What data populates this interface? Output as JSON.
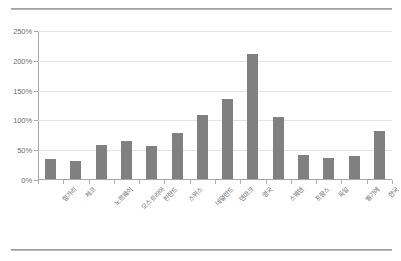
{
  "chart_data": {
    "type": "bar",
    "title": "",
    "xlabel": "",
    "ylabel": "",
    "ylim": [
      0,
      250
    ],
    "ytick_labels": [
      "0%",
      "50%",
      "100%",
      "150%",
      "200%",
      "250%"
    ],
    "ytick_values": [
      0,
      50,
      100,
      150,
      200,
      250
    ],
    "grid": true,
    "legend": false,
    "bar_color": "#808080",
    "gridline_color": "#e3e3e3",
    "axis_color": "#a6a6a6",
    "label_color": "#6b6b6b",
    "categories": [
      "헝가리",
      "체코",
      "노르웨이",
      "오스트리아",
      "핀란드",
      "스위스",
      "네덜란드",
      "덴마크",
      "영국",
      "스웨덴",
      "프랑스",
      "독일",
      "벨기에",
      "한국"
    ],
    "values": [
      34,
      31,
      57,
      63,
      56,
      78,
      107,
      134,
      210,
      104,
      40,
      36,
      39,
      81
    ],
    "value_labels": [
      "34%",
      "31%",
      "57%",
      "63%",
      "56%",
      "78%",
      "107%",
      "134%",
      "210%",
      "104%",
      "40%",
      "36%",
      "39%",
      "81%"
    ]
  }
}
